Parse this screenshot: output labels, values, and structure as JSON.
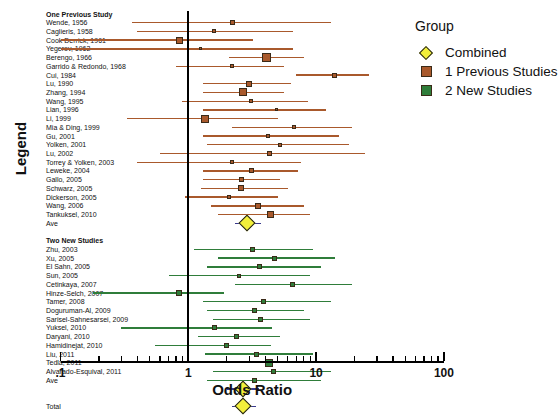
{
  "axis": {
    "ylabel": "Legend",
    "xlabel": "Odds Ratio",
    "xticklabels": [
      ".1",
      "1",
      "10",
      "100"
    ]
  },
  "legend": {
    "title": "Group",
    "items": [
      {
        "label": "Combined",
        "marker": "diamond-icon",
        "color": "#f2ef3a"
      },
      {
        "label": "1 Previous Studies",
        "marker": "square-icon",
        "color": "#a9592c"
      },
      {
        "label": "2 New Studies",
        "marker": "square-icon",
        "color": "#2f7d3a"
      }
    ]
  },
  "chart_data": {
    "type": "scatter",
    "subtype": "forest-plot",
    "title": "",
    "xlabel": "Odds Ratio",
    "ylabel": "Legend",
    "xscale": "log10",
    "xlim": [
      0.1,
      100
    ],
    "xticks": [
      0.1,
      1,
      10,
      100
    ],
    "grid": false,
    "reference_line": 1,
    "legend_position": "right",
    "series": [
      {
        "name": "1 Previous Studies",
        "color": "#a9592c",
        "rows": [
          {
            "label": "One Previous Study",
            "header": true
          },
          {
            "label": "Wende, 1956",
            "or": 2.2,
            "lo": 0.36,
            "hi": 13.0,
            "size": 5
          },
          {
            "label": "Caglieris, 1958",
            "or": 1.6,
            "lo": 0.4,
            "hi": 6.6,
            "size": 4
          },
          {
            "label": "Cook Derrick, 1961",
            "or": 0.85,
            "lo": 0.1,
            "hi": 3.2,
            "size": 7
          },
          {
            "label": "Yegerov, 1962",
            "or": 1.25,
            "lo": 0.1,
            "hi": 6.6,
            "size": 3
          },
          {
            "label": "Berengo, 1966",
            "or": 4.1,
            "lo": 2.1,
            "hi": 8.0,
            "size": 9
          },
          {
            "label": "Garrido & Redondo, 1968",
            "or": 2.2,
            "lo": 0.8,
            "hi": 5.6,
            "size": 4
          },
          {
            "label": "Cui, 1984",
            "or": 14.0,
            "lo": 7.0,
            "hi": 26.0,
            "size": 5
          },
          {
            "label": "Lu, 1990",
            "or": 3.0,
            "lo": 1.3,
            "hi": 6.4,
            "size": 6
          },
          {
            "label": "Zhang, 1994",
            "or": 2.7,
            "lo": 1.3,
            "hi": 5.6,
            "size": 8
          },
          {
            "label": "Wang, 1995",
            "or": 3.1,
            "lo": 0.9,
            "hi": 8.6,
            "size": 4
          },
          {
            "label": "Lian, 1996",
            "or": 4.9,
            "lo": 1.3,
            "hi": 12.0,
            "size": 3
          },
          {
            "label": "Li, 1999",
            "or": 1.35,
            "lo": 0.33,
            "hi": 5.0,
            "size": 8
          },
          {
            "label": "Mia & Ding, 1999",
            "or": 6.7,
            "lo": 2.2,
            "hi": 19.0,
            "size": 4
          },
          {
            "label": "Gu, 2001",
            "or": 4.2,
            "lo": 1.3,
            "hi": 15.0,
            "size": 4
          },
          {
            "label": "Yolken, 2001",
            "or": 5.2,
            "lo": 1.4,
            "hi": 18.0,
            "size": 4
          },
          {
            "label": "Lu, 2002",
            "or": 4.3,
            "lo": 0.6,
            "hi": 24.0,
            "size": 5
          },
          {
            "label": "Torrey & Yolken, 2003",
            "or": 2.2,
            "lo": 0.4,
            "hi": 7.6,
            "size": 4
          },
          {
            "label": "Leweke, 2004",
            "or": 3.1,
            "lo": 1.3,
            "hi": 7.2,
            "size": 5
          },
          {
            "label": "Gallo, 2005",
            "or": 2.6,
            "lo": 1.3,
            "hi": 5.2,
            "size": 5
          },
          {
            "label": "Schwarz, 2005",
            "or": 2.6,
            "lo": 1.25,
            "hi": 6.0,
            "size": 6
          },
          {
            "label": "Dickerson, 2005",
            "or": 2.1,
            "lo": 0.95,
            "hi": 5.0,
            "size": 4
          },
          {
            "label": "Wang, 2006",
            "or": 3.5,
            "lo": 1.5,
            "hi": 8.0,
            "size": 6
          },
          {
            "label": "Tankuksel, 2010",
            "or": 4.4,
            "lo": 1.7,
            "hi": 9.0,
            "size": 7
          },
          {
            "label": "Ave",
            "or": 2.9,
            "lo": 2.3,
            "hi": 3.7,
            "combined": true
          }
        ]
      },
      {
        "name": "2 New Studies",
        "color": "#2f7d3a",
        "rows": [
          {
            "label": "Two New Studies",
            "header": true
          },
          {
            "label": "Zhu, 2003",
            "or": 3.2,
            "lo": 1.1,
            "hi": 9.5,
            "size": 5
          },
          {
            "label": "Xu, 2005",
            "or": 4.7,
            "lo": 1.7,
            "hi": 14.0,
            "size": 5
          },
          {
            "label": "El Sahn, 2005",
            "or": 3.6,
            "lo": 1.4,
            "hi": 11.0,
            "size": 5
          },
          {
            "label": "Sun, 2005",
            "or": 2.5,
            "lo": 0.7,
            "hi": 9.0,
            "size": 4
          },
          {
            "label": "Cetinkaya, 2007",
            "or": 6.5,
            "lo": 2.3,
            "hi": 19.0,
            "size": 5
          },
          {
            "label": "Hinze-Selch, 2007",
            "or": 0.85,
            "lo": 0.18,
            "hi": 1.9,
            "size": 6
          },
          {
            "label": "Tamer, 2008",
            "or": 3.9,
            "lo": 1.3,
            "hi": 13.0,
            "size": 5
          },
          {
            "label": "Doguruman-Al, 2009",
            "or": 3.3,
            "lo": 1.4,
            "hi": 8.0,
            "size": 5
          },
          {
            "label": "Sarisel-Sahnesarsei, 2009",
            "or": 3.7,
            "lo": 1.55,
            "hi": 9.0,
            "size": 5
          },
          {
            "label": "Yuksel, 2010",
            "or": 1.6,
            "lo": 0.3,
            "hi": 4.5,
            "size": 5
          },
          {
            "label": "Daryani, 2010",
            "or": 2.4,
            "lo": 1.2,
            "hi": 5.2,
            "size": 5
          },
          {
            "label": "Hamidinejat, 2010",
            "or": 2.0,
            "lo": 0.55,
            "hi": 4.4,
            "size": 5
          },
          {
            "label": "Liu, 2011",
            "or": 3.4,
            "lo": 1.35,
            "hi": 9.5,
            "size": 5
          },
          {
            "label": "Tedla, 2011",
            "or": 4.3,
            "lo": 1.85,
            "hi": 11.0,
            "size": 8
          },
          {
            "label": "Alvarado-Esquival, 2011",
            "or": 4.6,
            "lo": 1.55,
            "hi": 13.0,
            "size": 5
          },
          {
            "label": "Ave",
            "or": 3.3,
            "lo": 1.4,
            "hi": 11.0,
            "size": 5,
            "extra_marker": true
          },
          {
            "label": "",
            "or": 2.7,
            "lo": 2.0,
            "hi": 3.6,
            "combined": true
          }
        ]
      },
      {
        "name": "Combined",
        "color": "#f2ef3a",
        "rows": [
          {
            "label": "Total",
            "or": 2.7,
            "lo": 2.2,
            "hi": 3.4,
            "combined": true
          }
        ]
      }
    ]
  }
}
